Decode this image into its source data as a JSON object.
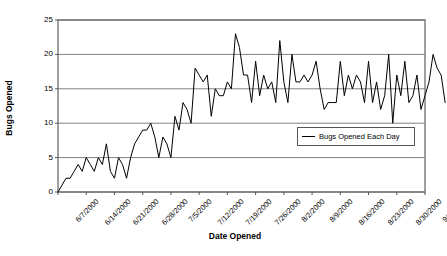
{
  "chart_data": {
    "type": "line",
    "title": "",
    "xlabel": "Date Opened",
    "ylabel": "Bugs Opened",
    "ylim": [
      0,
      25
    ],
    "yticks": [
      0,
      5,
      10,
      15,
      20,
      25
    ],
    "grid": true,
    "grid_axis": "y",
    "legend_position": "inside-right-lower",
    "line_color": "#000000",
    "axis_color": "#808080",
    "grid_color": "#808080",
    "xtick_labels": [
      "6/7/2000",
      "6/14/2000",
      "6/21/2000",
      "6/28/2000",
      "7/5/2000",
      "7/12/2000",
      "7/19/2000",
      "7/26/2000",
      "8/2/2000",
      "8/9/2000",
      "8/16/2000",
      "8/23/2000",
      "8/30/2000",
      "9/6/2000"
    ],
    "xtick_interval_days": 7,
    "x_start": "6/7/2000",
    "x_end": "9/6/2000",
    "series": [
      {
        "name": "Bugs Opened Each Day",
        "values": [
          0,
          1,
          2,
          2,
          3,
          4,
          3,
          5,
          4,
          3,
          5,
          4,
          7,
          3,
          2,
          5,
          4,
          2,
          5,
          7,
          8,
          9,
          9,
          10,
          8,
          5,
          8,
          7,
          5,
          11,
          9,
          13,
          12,
          10,
          18,
          17,
          16,
          17,
          11,
          15,
          14,
          14,
          16,
          15,
          23,
          21,
          17,
          17,
          13,
          19,
          14,
          17,
          15,
          16,
          13,
          22,
          16,
          13,
          20,
          16,
          16,
          17,
          16,
          17,
          19,
          15,
          12,
          13,
          13,
          13,
          19,
          14,
          17,
          15,
          17,
          16,
          13,
          19,
          13,
          16,
          12,
          14,
          20,
          10,
          17,
          14,
          19,
          13,
          14,
          17,
          12,
          14,
          16,
          20,
          18,
          17,
          13
        ]
      }
    ]
  },
  "legend": {
    "entries": [
      {
        "label": "Bugs Opened Each Day"
      }
    ]
  },
  "axes": {
    "y_title": "Bugs Opened",
    "x_title": "Date Opened"
  }
}
